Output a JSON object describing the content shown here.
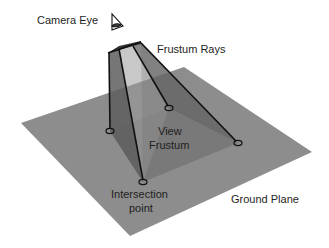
{
  "diagram": {
    "labels": {
      "camera_eye": "Camera Eye",
      "frustum_rays": "Frustum Rays",
      "view_frustum_line1": "View",
      "view_frustum_line2": "Frustum",
      "intersection_line1": "Intersection",
      "intersection_line2": "point",
      "ground_plane": "Ground Plane"
    },
    "icons": {
      "camera": "eye-in-triangle-icon"
    },
    "colors": {
      "ground_plane": "#8c8c8c",
      "frustum_light": "#9a9a9a",
      "frustum_mid": "#747474",
      "frustum_dark": "#5a5a5a",
      "ray": "#111111",
      "text": "#1e1e1e",
      "background": "#ffffff"
    }
  }
}
